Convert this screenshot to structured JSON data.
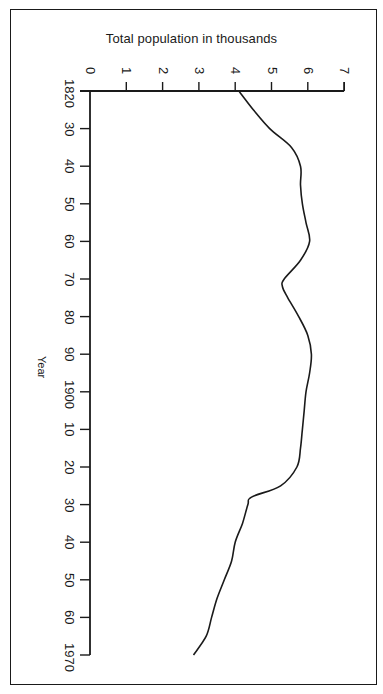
{
  "chart_data": {
    "type": "line",
    "orientation": "rotated 90 degrees clockwise (year axis runs top-to-bottom, value axis left-to-right)",
    "title": "Total population in thousands",
    "xlabel": "Year",
    "ylabel": "Total population in thousands",
    "x_tick_labels": [
      "1820",
      "30",
      "40",
      "50",
      "60",
      "70",
      "80",
      "90",
      "1900",
      "10",
      "20",
      "30",
      "40",
      "50",
      "60",
      "1970"
    ],
    "y_tick_labels": [
      "0",
      "1",
      "2",
      "3",
      "4",
      "5",
      "6",
      "7"
    ],
    "xlim": [
      1820,
      1970
    ],
    "ylim": [
      0,
      7
    ],
    "grid": false,
    "legend": null,
    "series": [
      {
        "name": "Total population (thousands)",
        "x": [
          1820,
          1825,
          1830,
          1835,
          1840,
          1845,
          1850,
          1855,
          1860,
          1865,
          1870,
          1872,
          1875,
          1880,
          1885,
          1890,
          1895,
          1900,
          1905,
          1910,
          1915,
          1920,
          1925,
          1928,
          1930,
          1935,
          1940,
          1945,
          1950,
          1955,
          1960,
          1965,
          1970
        ],
        "values": [
          4.1,
          4.5,
          4.95,
          5.55,
          5.8,
          5.8,
          5.85,
          5.95,
          6.05,
          5.8,
          5.35,
          5.3,
          5.45,
          5.75,
          6.0,
          6.1,
          6.05,
          5.95,
          5.9,
          5.85,
          5.8,
          5.7,
          5.25,
          4.45,
          4.35,
          4.2,
          4.0,
          3.9,
          3.7,
          3.5,
          3.35,
          3.2,
          2.85
        ]
      }
    ]
  },
  "labels": {
    "title": "Total population in thousands",
    "year_axis": "Year"
  }
}
